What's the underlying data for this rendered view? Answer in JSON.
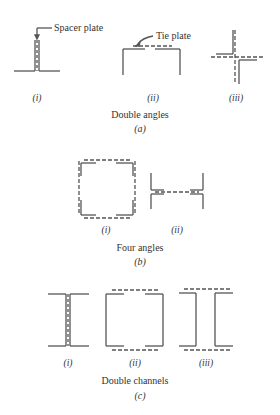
{
  "figure": {
    "panel_a": {
      "title": "Double angles",
      "letter": "(a)",
      "callouts": {
        "spacer_plate": "Spacer plate",
        "tie_plate": "Tie plate"
      },
      "items": [
        {
          "label": "(i)"
        },
        {
          "label": "(ii)"
        },
        {
          "label": "(iii)"
        }
      ]
    },
    "panel_b": {
      "title": "Four angles",
      "letter": "(b)",
      "items": [
        {
          "label": "(i)"
        },
        {
          "label": "(ii)"
        }
      ]
    },
    "panel_c": {
      "title": "Double channels",
      "letter": "(c)",
      "items": [
        {
          "label": "(i)"
        },
        {
          "label": "(ii)"
        },
        {
          "label": "(iii)"
        }
      ]
    }
  },
  "colors": {
    "line": "#555555",
    "text": "#333333",
    "background": "#ffffff"
  }
}
